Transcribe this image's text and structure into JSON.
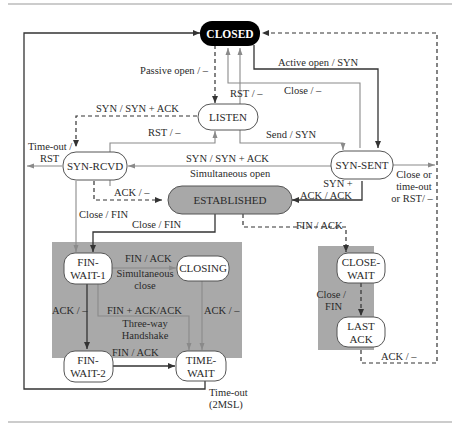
{
  "diagram": {
    "type": "state-machine",
    "colors": {
      "closed_fill": "#000000",
      "state_fill": "#ffffff",
      "established_fill": "#a8a8a8",
      "group_fill": "#a9a9a9",
      "line_dark": "#333333",
      "line_gray": "#8a8a8a",
      "frame_line": "#999999"
    },
    "states": {
      "closed": "CLOSED",
      "listen": "LISTEN",
      "syn_rcvd": "SYN-RCVD",
      "syn_sent": "SYN-SENT",
      "established": "ESTABLISHED",
      "fin_wait_1": [
        "FIN-",
        "WAIT-1"
      ],
      "fin_wait_2": [
        "FIN-",
        "WAIT-2"
      ],
      "closing": "CLOSING",
      "time_wait": [
        "TIME-",
        "WAIT"
      ],
      "close_wait": [
        "CLOSE-",
        "WAIT"
      ],
      "last_ack": [
        "LAST",
        "ACK"
      ]
    },
    "transitions": {
      "passive_open": "Passive open / –",
      "active_open": "Active open / SYN",
      "close_listen": "Close / –",
      "rst_listen": "RST / –",
      "syn_synack": "SYN / SYN + ACK",
      "rst_synrcvd": "RST / –",
      "send_syn": "Send / SYN",
      "timeout_rst": [
        "Time-out /",
        "RST"
      ],
      "simultaneous_open_label": "SYN / SYN + ACK",
      "simultaneous_open_caption": "Simultaneous open",
      "synack_ack": [
        "SYN +",
        "ACK / ACK"
      ],
      "close_timeout_rst": [
        "Close or",
        "time-out",
        "or RST/ –"
      ],
      "ack_established": "ACK / –",
      "close_fin_synrcvd": "Close / FIN",
      "close_fin_established": "Close / FIN",
      "fin_ack_closewait": "FIN / ACK",
      "fin_ack_closing": "FIN / ACK",
      "simultaneous_close": [
        "Simultaneous",
        "close"
      ],
      "ack_fw1": "ACK / –",
      "fin_ack_ack": "FIN + ACK/ACK",
      "three_way": [
        "Three-way",
        "Handshake"
      ],
      "ack_closing": "ACK / –",
      "fin_ack_fw2": "FIN / ACK",
      "close_fin_closewait": [
        "Close /",
        "FIN"
      ],
      "ack_lastack": "ACK / –",
      "timeout_2msl": [
        "Time-out",
        "(2MSL)"
      ]
    }
  }
}
